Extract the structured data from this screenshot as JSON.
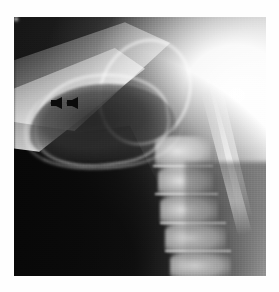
{
  "page": {
    "background_color": "#fefefe",
    "width": 279,
    "height": 292
  },
  "figure": {
    "name": "lateral-cervical-radiograph",
    "modality": "plain radiograph",
    "projection": "lateral",
    "region": "neck / cervical spine and upper airway",
    "background_color": "#2a2a2a",
    "frame": {
      "left": 14,
      "top": 17,
      "width": 252,
      "height": 259
    },
    "caption": ""
  },
  "annotations": {
    "markers": [
      {
        "name": "arrowhead-marker-1",
        "shape": "solid-black-arrowhead",
        "direction": "left",
        "color": "#0b0b0b",
        "x": 50,
        "y": 97
      },
      {
        "name": "arrowhead-marker-2",
        "shape": "solid-black-arrowhead",
        "direction": "left",
        "color": "#0b0b0b",
        "x": 66,
        "y": 97
      }
    ]
  },
  "anatomy_regions": [
    {
      "name": "mandible-ramus",
      "density": "bright",
      "location": "upper-left"
    },
    {
      "name": "airway-lucency",
      "density": "dark",
      "location": "left-center"
    },
    {
      "name": "hyoid-epiglottis-arcs",
      "density": "bright",
      "location": "upper-center"
    },
    {
      "name": "soft-tissue-shadow",
      "density": "very-dark",
      "location": "lower-left"
    },
    {
      "name": "cervical-vertebral-bodies",
      "density": "bright",
      "location": "right-lower"
    },
    {
      "name": "spinous-processes",
      "density": "bright-linear",
      "location": "right"
    },
    {
      "name": "overexposed-field",
      "density": "white",
      "location": "upper-right"
    }
  ]
}
